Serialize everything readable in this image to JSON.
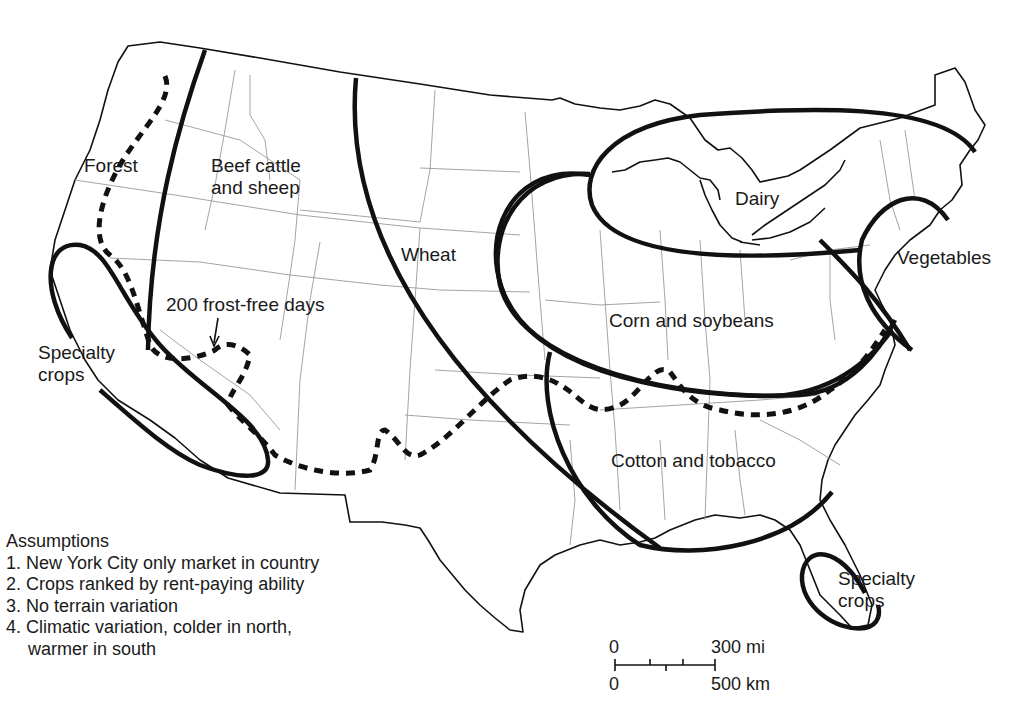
{
  "map": {
    "type": "thematic-map",
    "subject": "Von Thünen model applied to United States agricultural regions"
  },
  "regions": [
    {
      "id": "forest",
      "label": "Forest"
    },
    {
      "id": "beef",
      "label_line1": "Beef cattle",
      "label_line2": "and sheep"
    },
    {
      "id": "wheat",
      "label": "Wheat"
    },
    {
      "id": "dairy",
      "label": "Dairy"
    },
    {
      "id": "vegetables",
      "label": "Vegetables"
    },
    {
      "id": "corn",
      "label": "Corn and soybeans"
    },
    {
      "id": "cotton",
      "label": "Cotton and tobacco"
    },
    {
      "id": "specialty_west",
      "label_line1": "Specialty",
      "label_line2": "crops"
    },
    {
      "id": "specialty_florida",
      "label_line1": "Specialty",
      "label_line2": "crops"
    }
  ],
  "annotations": {
    "frost_line": "200 frost-free days"
  },
  "assumptions": {
    "title": "Assumptions",
    "items": [
      "1. New York City only market in country",
      "2. Crops ranked by rent-paying ability",
      "3. No terrain variation",
      "4. Climatic variation, colder in north,",
      "warmer in south"
    ]
  },
  "scale_bar": {
    "top_left": "0",
    "top_right": "300 mi",
    "bottom_left": "0",
    "bottom_right": "500 km"
  },
  "colors": {
    "line": "#111111",
    "state_border": "#9a9a9a",
    "background": "#ffffff"
  }
}
